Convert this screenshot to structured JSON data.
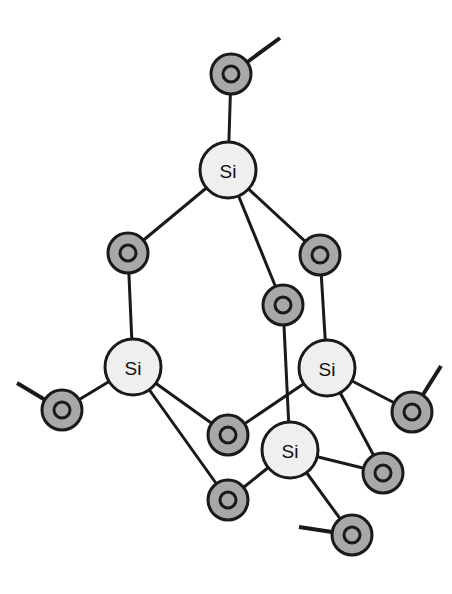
{
  "diagram": {
    "type": "molecular-structure",
    "background_color": "#ffffff",
    "canvas": {
      "width": 452,
      "height": 594
    },
    "style": {
      "si_fill": "#efefef",
      "si_stroke": "#1a1a1a",
      "si_radius": 28,
      "o_fill": "#a8a8a8",
      "o_stroke": "#1a1a1a",
      "o_radius": 20,
      "o_inner_radius": 8,
      "o_inner_fill": "#a8a8a8",
      "bond_color": "#1a1a1a",
      "bond_width": 3,
      "stub_width": 4
    },
    "atoms": [
      {
        "id": "O1",
        "element": "O",
        "label": "O",
        "x": 231,
        "y": 74,
        "kind": "oxygen",
        "role": "terminal-bridging-top"
      },
      {
        "id": "Si1",
        "element": "Si",
        "label": "Si",
        "x": 228,
        "y": 170,
        "kind": "silicon",
        "role": "apex-silicon"
      },
      {
        "id": "O2",
        "element": "O",
        "label": "O",
        "x": 128,
        "y": 253,
        "kind": "oxygen",
        "role": "bridging-left"
      },
      {
        "id": "O3",
        "element": "O",
        "label": "O",
        "x": 320,
        "y": 255,
        "kind": "oxygen",
        "role": "bridging-right"
      },
      {
        "id": "O4",
        "element": "O",
        "label": "O",
        "x": 283,
        "y": 305,
        "kind": "oxygen",
        "role": "bridging-center"
      },
      {
        "id": "Si2",
        "element": "Si",
        "label": "Si",
        "x": 133,
        "y": 367,
        "kind": "silicon",
        "role": "left-silicon"
      },
      {
        "id": "Si3",
        "element": "Si",
        "label": "Si",
        "x": 327,
        "y": 368,
        "kind": "silicon",
        "role": "right-silicon"
      },
      {
        "id": "O5",
        "element": "O",
        "label": "O",
        "x": 62,
        "y": 410,
        "kind": "oxygen",
        "role": "terminal-left"
      },
      {
        "id": "O6",
        "element": "O",
        "label": "O",
        "x": 412,
        "y": 412,
        "kind": "oxygen",
        "role": "terminal-right-upper"
      },
      {
        "id": "O7",
        "element": "O",
        "label": "O",
        "x": 228,
        "y": 435,
        "kind": "oxygen",
        "role": "bridging-lower-center"
      },
      {
        "id": "Si4",
        "element": "Si",
        "label": "Si",
        "x": 290,
        "y": 450,
        "kind": "silicon",
        "role": "bottom-silicon"
      },
      {
        "id": "O8",
        "element": "O",
        "label": "O",
        "x": 383,
        "y": 473,
        "kind": "oxygen",
        "role": "terminal-right-lower"
      },
      {
        "id": "O9",
        "element": "O",
        "label": "O",
        "x": 228,
        "y": 500,
        "kind": "oxygen",
        "role": "bridging-bottom-left"
      },
      {
        "id": "O10",
        "element": "O",
        "label": "O",
        "x": 352,
        "y": 535,
        "kind": "oxygen",
        "role": "terminal-bottom"
      }
    ],
    "bonds": [
      {
        "from": "O1",
        "to": "Si1",
        "kind": "single"
      },
      {
        "from": "Si1",
        "to": "O2",
        "kind": "single"
      },
      {
        "from": "Si1",
        "to": "O3",
        "kind": "single"
      },
      {
        "from": "Si1",
        "to": "O4",
        "kind": "single"
      },
      {
        "from": "O2",
        "to": "Si2",
        "kind": "single"
      },
      {
        "from": "O3",
        "to": "Si3",
        "kind": "single"
      },
      {
        "from": "O4",
        "to": "Si4",
        "kind": "single"
      },
      {
        "from": "Si2",
        "to": "O5",
        "kind": "single"
      },
      {
        "from": "Si2",
        "to": "O7",
        "kind": "single"
      },
      {
        "from": "Si2",
        "to": "O9",
        "kind": "single"
      },
      {
        "from": "Si3",
        "to": "O7",
        "kind": "single"
      },
      {
        "from": "Si3",
        "to": "O6",
        "kind": "single"
      },
      {
        "from": "Si3",
        "to": "O8",
        "kind": "single"
      },
      {
        "from": "Si4",
        "to": "O9",
        "kind": "single"
      },
      {
        "from": "Si4",
        "to": "O8",
        "kind": "single"
      },
      {
        "from": "Si4",
        "to": "O10",
        "kind": "single"
      }
    ],
    "open_bond_stubs": [
      {
        "atom": "O1",
        "x2": 280,
        "y2": 38,
        "role": "continuation-top-right"
      },
      {
        "atom": "O5",
        "x2": 17,
        "y2": 383,
        "role": "continuation-left"
      },
      {
        "atom": "O6",
        "x2": 441,
        "y2": 366,
        "role": "continuation-right"
      },
      {
        "atom": "O10",
        "x2": 299,
        "y2": 527,
        "role": "continuation-bottom-left"
      }
    ]
  }
}
